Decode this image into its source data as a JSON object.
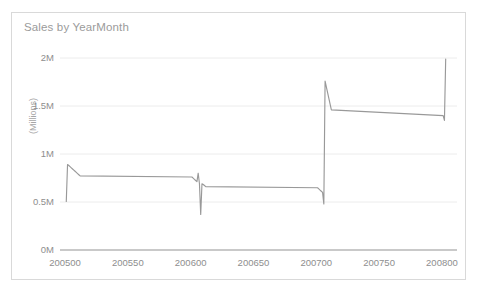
{
  "card": {
    "title": "Sales by YearMonth",
    "border_color": "#d9d9d9",
    "background": "#ffffff"
  },
  "chart_data": {
    "type": "line",
    "title": "Sales by YearMonth",
    "xlabel": "",
    "ylabel": "(Millions)",
    "ylim": [
      0,
      2100000
    ],
    "xlim": [
      200496,
      200812
    ],
    "grid": true,
    "legend": null,
    "line_color": "#999999",
    "y_ticks": [
      {
        "value": 0,
        "label": "0M"
      },
      {
        "value": 500000,
        "label": "0.5M"
      },
      {
        "value": 1000000,
        "label": "1M"
      },
      {
        "value": 1500000,
        "label": "1.5M"
      },
      {
        "value": 2000000,
        "label": "2M"
      }
    ],
    "x_ticks": [
      {
        "value": 200500,
        "label": "200500"
      },
      {
        "value": 200550,
        "label": "200550"
      },
      {
        "value": 200600,
        "label": "200600"
      },
      {
        "value": 200650,
        "label": "200650"
      },
      {
        "value": 200700,
        "label": "200700"
      },
      {
        "value": 200750,
        "label": "200750"
      },
      {
        "value": 200800,
        "label": "200800"
      }
    ],
    "series": [
      {
        "name": "Sales",
        "x": [
          200501,
          200502,
          200503,
          200504,
          200505,
          200506,
          200507,
          200508,
          200509,
          200510,
          200511,
          200512,
          200601,
          200602,
          200603,
          200604,
          200605,
          200606,
          200607,
          200608,
          200609,
          200610,
          200611,
          200612,
          200701,
          200702,
          200703,
          200704,
          200705,
          200706,
          200707,
          200708,
          200709,
          200710,
          200711,
          200712,
          200801,
          200802,
          200803
        ],
        "values": [
          505000,
          890000,
          880000,
          868000,
          856000,
          844000,
          832000,
          820000,
          808000,
          796000,
          784000,
          772000,
          760000,
          748000,
          736000,
          724000,
          712000,
          800000,
          690000,
          370000,
          690000,
          682000,
          672000,
          660000,
          648000,
          636000,
          624000,
          612000,
          600000,
          480000,
          1760000,
          1700000,
          1640000,
          1580000,
          1520000,
          1460000,
          1400000,
          1350000,
          1990000
        ]
      }
    ]
  }
}
